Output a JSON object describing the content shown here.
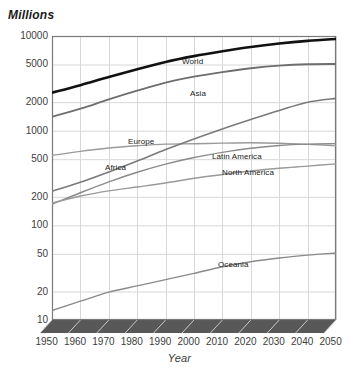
{
  "chart_data": {
    "type": "line",
    "title": "",
    "xlabel": "Year",
    "ylabel": "Millions",
    "yscale": "log",
    "ylim": [
      10,
      10000
    ],
    "xlim": [
      1950,
      2050
    ],
    "grid": true,
    "legend_position": "inline-labels",
    "ytick_labels": [
      "10000",
      "5000",
      "2000",
      "1000",
      "500",
      "200",
      "100",
      "50",
      "20",
      "10"
    ],
    "ytick_values": [
      10000,
      5000,
      2000,
      1000,
      500,
      200,
      100,
      50,
      20,
      10
    ],
    "xtick_labels": [
      "1950",
      "1960",
      "1970",
      "1980",
      "1990",
      "2000",
      "2010",
      "2020",
      "2030",
      "2040",
      "2050"
    ],
    "x": [
      1950,
      1960,
      1970,
      1980,
      1990,
      2000,
      2010,
      2020,
      2030,
      2040,
      2050
    ],
    "series": [
      {
        "name": "World",
        "color": "#111111",
        "width": 2.6,
        "values": [
          2525,
          3026,
          3691,
          4449,
          5320,
          6127,
          6896,
          7656,
          8321,
          8874,
          9306
        ]
      },
      {
        "name": "Asia",
        "color": "#6e6e6e",
        "width": 1.8,
        "values": [
          1403,
          1705,
          2138,
          2642,
          3210,
          3717,
          4164,
          4565,
          4868,
          5032,
          5061
        ]
      },
      {
        "name": "Europe",
        "color": "#9a9a9a",
        "width": 1.4,
        "values": [
          547,
          605,
          656,
          693,
          721,
          727,
          738,
          744,
          736,
          716,
          691
        ]
      },
      {
        "name": "Africa",
        "color": "#7a7a7a",
        "width": 1.6,
        "values": [
          229,
          285,
          366,
          478,
          632,
          819,
          1044,
          1312,
          1634,
          1999,
          2192
        ]
      },
      {
        "name": "Latin America",
        "color": "#8a8a8a",
        "width": 1.4,
        "values": [
          167,
          221,
          288,
          364,
          443,
          521,
          590,
          652,
          698,
          721,
          729
        ]
      },
      {
        "name": "North America",
        "color": "#9a9a9a",
        "width": 1.4,
        "values": [
          172,
          204,
          231,
          254,
          280,
          314,
          344,
          375,
          401,
          422,
          446
        ]
      },
      {
        "name": "Oceania",
        "color": "#8a8a8a",
        "width": 1.4,
        "values": [
          12.6,
          15.8,
          19.7,
          22.9,
          26.7,
          31.1,
          36.5,
          41.3,
          45.2,
          48.4,
          51.1
        ]
      }
    ],
    "series_label_positions": [
      {
        "name": "World",
        "x": 182,
        "y": 57
      },
      {
        "name": "Asia",
        "x": 190,
        "y": 89
      },
      {
        "name": "Europe",
        "x": 128,
        "y": 137
      },
      {
        "name": "Africa",
        "x": 105,
        "y": 163
      },
      {
        "name": "Latin America",
        "x": 212,
        "y": 152
      },
      {
        "name": "North America",
        "x": 222,
        "y": 168
      },
      {
        "name": "Oceania",
        "x": 218,
        "y": 260
      }
    ]
  }
}
